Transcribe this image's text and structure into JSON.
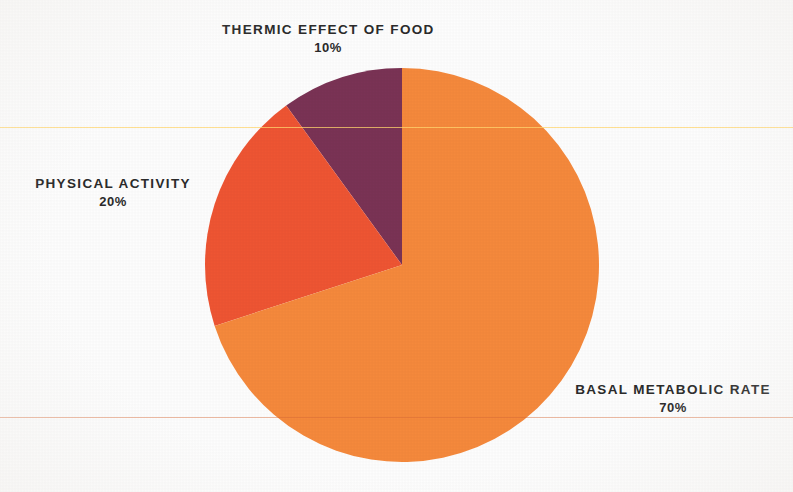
{
  "chart_data": {
    "type": "pie",
    "title": "",
    "subtitle": "",
    "xlabel": "",
    "ylabel": "",
    "legend_position": "none",
    "grid": false,
    "labels_inline": true,
    "unit": "%",
    "categories": [
      "Thermic Effect of Food",
      "Physical Activity",
      "Basal Metabolic Rate"
    ],
    "values": [
      10,
      20,
      70
    ],
    "colors": [
      "#7a3355",
      "#ee5533",
      "#f5893c"
    ],
    "start_angle_deg": 0,
    "direction": "counterclockwise",
    "slices": [
      {
        "label": "THERMIC EFFECT OF FOOD",
        "value_label": "10%",
        "value": 10,
        "color": "#7a3355",
        "start_deg": 0,
        "end_deg": 36
      },
      {
        "label": "PHYSICAL ACTIVITY",
        "value_label": "20%",
        "value": 20,
        "color": "#ee5533",
        "start_deg": 36,
        "end_deg": 108
      },
      {
        "label": "BASAL METABOLIC RATE",
        "value_label": "70%",
        "value": 70,
        "color": "#f5893c",
        "start_deg": 108,
        "end_deg": 360
      }
    ]
  },
  "canvas": {
    "background_color": "#fdfdfd",
    "text_color": "#2b2b2b",
    "width": 793,
    "height": 492
  },
  "geometry": {
    "center_x": 402,
    "center_y": 265,
    "radius": 197
  },
  "labels": {
    "thermic": {
      "title": "THERMIC EFFECT OF FOOD",
      "value": "10%"
    },
    "activity": {
      "title": "PHYSICAL ACTIVITY",
      "value": "20%"
    },
    "bmr": {
      "title": "BASAL METABOLIC RATE",
      "value": "70%"
    }
  }
}
